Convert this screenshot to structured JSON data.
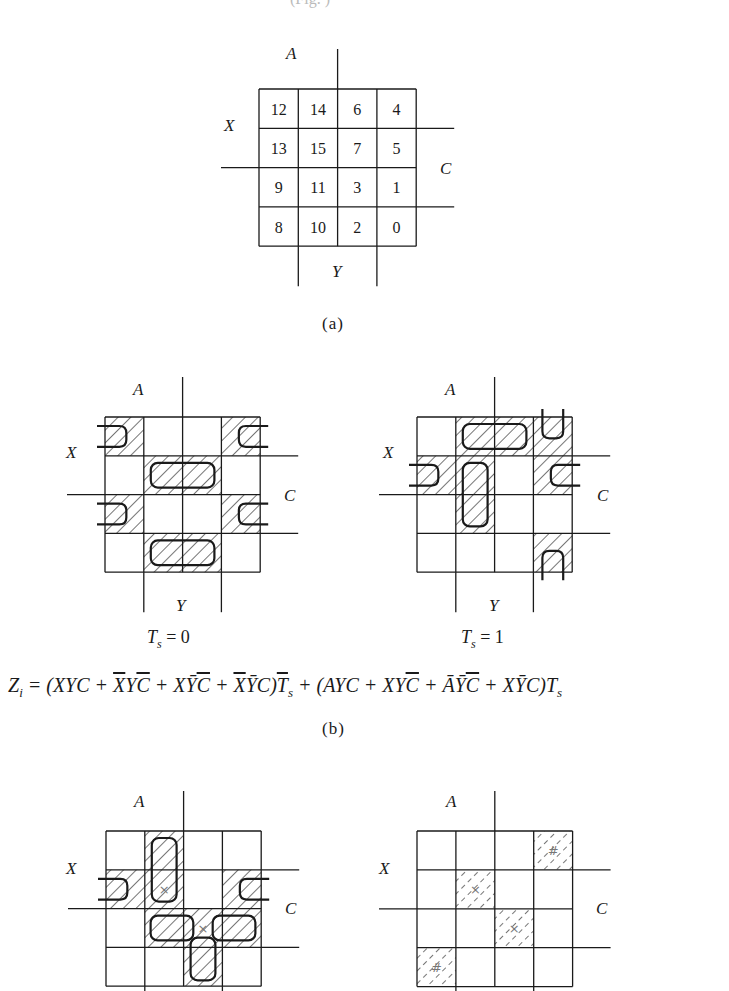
{
  "figure": {
    "top_cropped_text": "(Fig. )",
    "captions": {
      "a": "(a)",
      "b": "(b)"
    },
    "variable_labels": {
      "A": "A",
      "X": "X",
      "C": "C",
      "Y": "Y"
    },
    "cell_layout": [
      [
        12,
        14,
        6,
        4
      ],
      [
        13,
        15,
        7,
        5
      ],
      [
        9,
        11,
        3,
        1
      ],
      [
        8,
        10,
        2,
        0
      ]
    ],
    "maps": [
      {
        "id": "a",
        "x": 259,
        "y": 89,
        "cell": 39.3,
        "numbered": true,
        "hatched": [],
        "hatch_style": "solid",
        "marks": {}
      },
      {
        "id": "b-left",
        "x": 105,
        "y": 417,
        "cell": 38.8,
        "ts_label": {
          "T": "T",
          "s": "s",
          "eq": " = 0"
        },
        "hatched": [
          12,
          4,
          15,
          7,
          9,
          1,
          10,
          2
        ],
        "hatch_style": "solid",
        "marks": {},
        "loops": [
          {
            "type": "hwrap",
            "row": 0
          },
          {
            "type": "hwrap",
            "row": 2
          },
          {
            "type": "rect",
            "r0": 1,
            "c0": 1,
            "r1": 1,
            "c1": 2
          },
          {
            "type": "rect",
            "r0": 3,
            "c0": 1,
            "r1": 3,
            "c1": 2
          }
        ]
      },
      {
        "id": "b-right",
        "x": 417,
        "y": 417,
        "cell": 38.8,
        "ts_label": {
          "T": "T",
          "s": "s",
          "eq": " = 1"
        },
        "hatched": [
          14,
          6,
          4,
          13,
          15,
          5,
          11,
          0
        ],
        "hatch_style": "solid",
        "marks": {},
        "loops": [
          {
            "type": "rect",
            "r0": 0,
            "c0": 1,
            "r1": 0,
            "c1": 2
          },
          {
            "type": "rect",
            "r0": 1,
            "c0": 1,
            "r1": 2,
            "c1": 1
          },
          {
            "type": "hwrap",
            "row": 1
          },
          {
            "type": "vwrap",
            "col": 3
          }
        ]
      },
      {
        "id": "c-left",
        "x": 106,
        "y": 831,
        "cell": 38.8,
        "hatched": [
          14,
          13,
          15,
          5,
          11,
          3,
          1,
          2
        ],
        "hatch_style": "solid",
        "marks": {
          "15": "×",
          "3": "×"
        },
        "loops": [
          {
            "type": "rect",
            "r0": 0,
            "c0": 1,
            "r1": 1,
            "c1": 1
          },
          {
            "type": "hwrap",
            "row": 1
          },
          {
            "type": "rectpart",
            "r": 2,
            "x0": 1.15,
            "x1": 2.25
          },
          {
            "type": "rectpart",
            "r": 2,
            "x0": 2.75,
            "x1": 3.85
          },
          {
            "type": "rectv",
            "c": 2,
            "y0": 2.75,
            "y1": 3.85
          }
        ]
      },
      {
        "id": "c-right",
        "x": 417,
        "y": 831,
        "cell": 38.9,
        "hatched": [
          4,
          15,
          3,
          8
        ],
        "hatch_style": "dashed",
        "marks": {
          "4": "#",
          "15": "×",
          "3": "×",
          "8": "#"
        },
        "loops": []
      }
    ],
    "equation": {
      "lhs": "Z",
      "lhs_sub": "i",
      "text": "= (XYC + X̄YC̄ + XȲC̄ + X̄ȲC)T̄s + (AYC + XYC̄ + ĀȲC̄ + XȲC)Ts",
      "terms_ts0": [
        "XYC",
        "X̄YC̄",
        "XȲC̄",
        "X̄ȲC"
      ],
      "terms_ts1": [
        "AYC",
        "XYC̄",
        "ĀȲC̄",
        "XȲC"
      ]
    }
  }
}
